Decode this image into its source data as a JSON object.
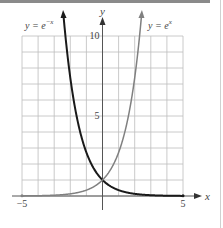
{
  "chart_data": {
    "type": "line",
    "title": "",
    "xlabel": "x",
    "ylabel": "y",
    "xlim": [
      -5,
      5
    ],
    "ylim": [
      0,
      10
    ],
    "grid": true,
    "x_ticks": [
      {
        "value": -5,
        "label": "−5"
      },
      {
        "value": 5,
        "label": "5"
      }
    ],
    "y_ticks": [
      {
        "value": 5,
        "label": "5"
      },
      {
        "value": 10,
        "label": "10"
      }
    ],
    "series": [
      {
        "name": "y = e^{-x}",
        "label": "y = e",
        "exponent": "−x",
        "function": "exp(-x)",
        "color": "#1a1a1a",
        "x": [
          -2.4,
          -2,
          -1.5,
          -1,
          -0.5,
          0,
          0.5,
          1,
          1.5,
          2,
          3,
          4,
          5
        ],
        "values": [
          11.02,
          7.39,
          4.48,
          2.72,
          1.65,
          1.0,
          0.61,
          0.37,
          0.22,
          0.14,
          0.05,
          0.02,
          0.01
        ]
      },
      {
        "name": "y = e^{x}",
        "label": "y = e",
        "exponent": "x",
        "function": "exp(x)",
        "color": "#808080",
        "x": [
          -5,
          -4,
          -3,
          -2,
          -1.5,
          -1,
          -0.5,
          0,
          0.5,
          1,
          1.5,
          2,
          2.4
        ],
        "values": [
          0.01,
          0.02,
          0.05,
          0.14,
          0.22,
          0.37,
          0.61,
          1.0,
          1.65,
          2.72,
          4.48,
          7.39,
          11.02
        ]
      }
    ],
    "annotations": [
      {
        "text": "y = e^{-x}",
        "position": "upper-left"
      },
      {
        "text": "y = e^{x}",
        "position": "upper-right"
      }
    ],
    "intersection": {
      "x": 0,
      "y": 1
    }
  }
}
